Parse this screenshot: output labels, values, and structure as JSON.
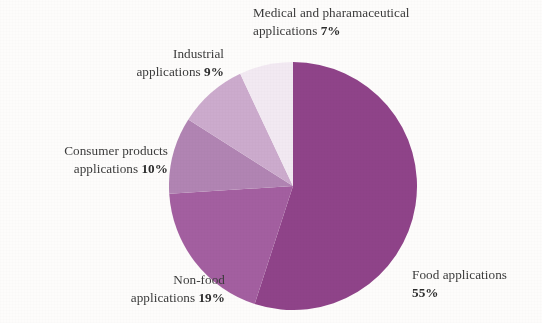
{
  "chart_data": {
    "type": "pie",
    "title": "",
    "subtitle": "",
    "xlabel": "",
    "ylabel": "",
    "legend_position": "none",
    "grid": false,
    "labels_outside": true,
    "start_angle_deg": 0,
    "direction": "clockwise",
    "categories": [
      "Food applications",
      "Non-food applications",
      "Consumer products applications",
      "Industrial applications",
      "Medical and pharamaceutical applications"
    ],
    "values": [
      55,
      19,
      10,
      9,
      7
    ],
    "value_unit": "%",
    "colors": [
      "#8f4389",
      "#a35fa0",
      "#b184b3",
      "#ccabcd",
      "#f2e9f2"
    ],
    "slices": [
      {
        "name": "Food applications",
        "value": 55,
        "value_label": "55%",
        "color": "#8f4389",
        "start_deg": 0,
        "end_deg": 198
      },
      {
        "name": "Non-food applications",
        "value": 19,
        "value_label": "19%",
        "color": "#a35fa0",
        "start_deg": 198,
        "end_deg": 266.4
      },
      {
        "name": "Consumer products applications",
        "value": 10,
        "value_label": "10%",
        "color": "#b184b3",
        "start_deg": 266.4,
        "end_deg": 302.4
      },
      {
        "name": "Industrial applications",
        "value": 9,
        "value_label": "9%",
        "color": "#ccabcd",
        "start_deg": 302.4,
        "end_deg": 334.8
      },
      {
        "name": "Medical and pharamaceutical applications",
        "value": 7,
        "value_label": "7%",
        "color": "#f2e9f2",
        "start_deg": 334.8,
        "end_deg": 360
      }
    ]
  },
  "labels": {
    "medical": {
      "line1": "Medical and pharamaceutical",
      "line2_text": "applications ",
      "line2_value": "7%"
    },
    "industrial": {
      "line1": "Industrial",
      "line2_text": "applications ",
      "line2_value": "9%"
    },
    "consumer": {
      "line1": "Consumer products",
      "line2_text": "applications ",
      "line2_value": "10%"
    },
    "nonfood": {
      "line1": "Non-food",
      "line2_text": "applications ",
      "line2_value": "19%"
    },
    "food": {
      "line1": "Food applications",
      "line2_text": "",
      "line2_value": "55%"
    }
  },
  "style": {
    "background": "#fdfcfb",
    "text_color": "#3b3b3b"
  }
}
